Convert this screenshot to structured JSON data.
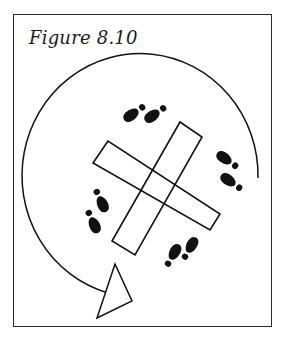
{
  "figure": {
    "title": "Figure 8.10",
    "colors": {
      "ink": "#111111",
      "frame": "#2a2a2a",
      "background": "#ffffff"
    },
    "elements": {
      "rotation_arc": "clockwise circular path with arrowhead",
      "cross": "two overlapping rectangles forming an X",
      "footprint_pairs": 4
    }
  }
}
